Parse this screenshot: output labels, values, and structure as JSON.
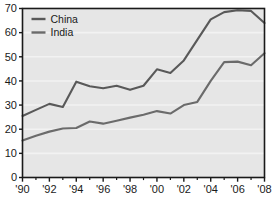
{
  "chart_data": {
    "type": "line",
    "title": "",
    "subtitle": "",
    "xlabel": "",
    "ylabel": "",
    "xlim": [
      1990,
      2008
    ],
    "ylim": [
      0,
      70
    ],
    "grid": true,
    "grid_axis": "y",
    "legend_position": "top-left",
    "x": [
      1990,
      1991,
      1992,
      1993,
      1994,
      1995,
      1996,
      1997,
      1998,
      1999,
      2000,
      2001,
      2002,
      2003,
      2004,
      2005,
      2006,
      2007,
      2008
    ],
    "y_ticks": [
      0,
      10,
      20,
      30,
      40,
      50,
      60,
      70
    ],
    "y_tick_labels": [
      "0",
      "10",
      "20",
      "30",
      "40",
      "50",
      "60",
      "70"
    ],
    "x_ticks": [
      1990,
      1992,
      1994,
      1996,
      1998,
      2000,
      2002,
      2004,
      2006,
      2008
    ],
    "x_tick_labels": [
      "'90",
      "'92",
      "'94",
      "'96",
      "'98",
      "'00",
      "'02",
      "'04",
      "'06",
      "'08"
    ],
    "x_minor_ticks": [
      1991,
      1993,
      1995,
      1997,
      1999,
      2001,
      2003,
      2005,
      2007
    ],
    "series": [
      {
        "name": "China",
        "color": "#595959",
        "values": [
          25.5,
          28.0,
          30.5,
          29.2,
          39.7,
          37.8,
          37.0,
          38.0,
          36.3,
          38.0,
          44.8,
          43.3,
          48.5,
          57.0,
          65.5,
          68.5,
          69.3,
          69.0,
          64.0
        ]
      },
      {
        "name": "India",
        "color": "#6b6b6b",
        "values": [
          15.3,
          17.3,
          19.0,
          20.3,
          20.5,
          23.2,
          22.3,
          23.5,
          24.8,
          26.0,
          27.5,
          26.5,
          30.0,
          31.3,
          40.0,
          47.8,
          48.0,
          46.5,
          51.5
        ]
      }
    ]
  },
  "style": {
    "plot_background": "#e6e6e6",
    "gridline_color": "#f2f2f2",
    "axis_color": "#1a1a1a",
    "page_background": "#ffffff",
    "text_color": "#1a1a1a"
  },
  "legend": {
    "entries": [
      {
        "label": "China",
        "color": "#595959"
      },
      {
        "label": "India",
        "color": "#6b6b6b"
      }
    ]
  }
}
